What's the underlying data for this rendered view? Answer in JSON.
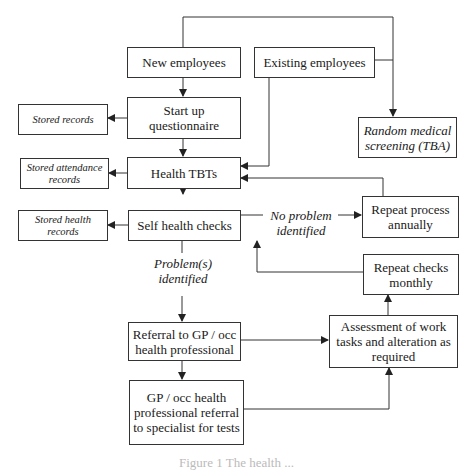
{
  "diagram": {
    "type": "flowchart",
    "nodes": {
      "new_employees": "New employees",
      "existing_employees": "Existing employees",
      "random_screening": "Random medical screening (TBA)",
      "startup_questionnaire": "Start up questionnaire",
      "stored_records": "Stored records",
      "health_tbts": "Health TBTs",
      "stored_attendance": "Stored attendance records",
      "self_checks": "Self health checks",
      "stored_health": "Stored health records",
      "repeat_annually": "Repeat process annually",
      "repeat_monthly": "Repeat checks monthly",
      "referral_gp": "Referral to GP / occ health professional",
      "assessment": "Assessment of work tasks and alteration as required",
      "specialist_referral": "GP / occ health professional referral to specialist for tests"
    },
    "edge_labels": {
      "no_problem": "No problem identified",
      "problems": "Problem(s) identified"
    },
    "edges": [
      {
        "from": "new_employees",
        "to": "startup_questionnaire"
      },
      {
        "from": "new_employees",
        "to": "random_screening"
      },
      {
        "from": "existing_employees",
        "to": "random_screening"
      },
      {
        "from": "existing_employees",
        "to": "health_tbts"
      },
      {
        "from": "startup_questionnaire",
        "to": "stored_records"
      },
      {
        "from": "startup_questionnaire",
        "to": "health_tbts"
      },
      {
        "from": "health_tbts",
        "to": "stored_attendance"
      },
      {
        "from": "health_tbts",
        "to": "self_checks"
      },
      {
        "from": "self_checks",
        "to": "stored_health"
      },
      {
        "from": "self_checks",
        "to": "repeat_annually",
        "label": "No problem identified"
      },
      {
        "from": "repeat_annually",
        "to": "health_tbts"
      },
      {
        "from": "self_checks",
        "to": "referral_gp",
        "label": "Problem(s) identified"
      },
      {
        "from": "referral_gp",
        "to": "assessment"
      },
      {
        "from": "referral_gp",
        "to": "specialist_referral"
      },
      {
        "from": "specialist_referral",
        "to": "assessment"
      },
      {
        "from": "assessment",
        "to": "repeat_monthly"
      },
      {
        "from": "repeat_monthly",
        "to": "self_checks"
      }
    ],
    "caption": "Figure 1 The health ..."
  }
}
